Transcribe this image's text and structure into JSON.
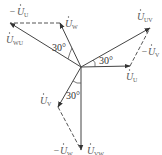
{
  "diagram": {
    "type": "phasor diagram",
    "origin": {
      "x": 81,
      "y": 67
    },
    "phasors": [
      {
        "id": "U_U",
        "label": "U",
        "sub": "U",
        "prefix": "",
        "style": "solid",
        "from": [
          81,
          67
        ],
        "to": [
          130,
          66
        ],
        "label_pos": [
          124,
          80
        ]
      },
      {
        "id": "U_V",
        "label": "U",
        "sub": "V",
        "prefix": "",
        "style": "solid",
        "from": [
          81,
          67
        ],
        "to": [
          58,
          107
        ],
        "label_pos": [
          40,
          104
        ]
      },
      {
        "id": "U_W",
        "label": "U",
        "sub": "W",
        "prefix": "",
        "style": "solid",
        "from": [
          81,
          67
        ],
        "to": [
          60,
          23
        ],
        "label_pos": [
          64,
          24
        ]
      },
      {
        "id": "U_UV",
        "label": "U",
        "sub": "UV",
        "prefix": "",
        "style": "solid",
        "from": [
          81,
          67
        ],
        "to": [
          150,
          28
        ],
        "label_pos": [
          136,
          20
        ]
      },
      {
        "id": "U_WU",
        "label": "U",
        "sub": "WU",
        "prefix": "",
        "style": "solid",
        "from": [
          81,
          67
        ],
        "to": [
          10,
          23
        ],
        "label_pos": [
          6,
          40
        ]
      },
      {
        "id": "U_VW",
        "label": "U",
        "sub": "VW",
        "prefix": "",
        "style": "solid",
        "from": [
          81,
          67
        ],
        "to": [
          81,
          150
        ],
        "label_pos": [
          86,
          154
        ]
      },
      {
        "id": "neg_U_V",
        "label": "U",
        "sub": "V",
        "prefix": "−",
        "style": "dashed",
        "from": [
          130,
          66
        ],
        "to": [
          150,
          28
        ],
        "label_pos": [
          130,
          56
        ]
      },
      {
        "id": "neg_U_U",
        "label": "U",
        "sub": "U",
        "prefix": "−",
        "style": "dashed",
        "from": [
          60,
          23
        ],
        "to": [
          10,
          23
        ],
        "label_pos": [
          10,
          14
        ]
      },
      {
        "id": "neg_U_W",
        "label": "U",
        "sub": "W",
        "prefix": "−",
        "style": "dashed",
        "from": [
          58,
          107
        ],
        "to": [
          81,
          150
        ],
        "label_pos": [
          55,
          154
        ]
      }
    ],
    "angles": [
      {
        "text": "30°",
        "pos": [
          52,
          48
        ]
      },
      {
        "text": "30°",
        "pos": [
          98,
          64
        ]
      },
      {
        "text": "30°",
        "pos": [
          66,
          96
        ]
      }
    ]
  }
}
